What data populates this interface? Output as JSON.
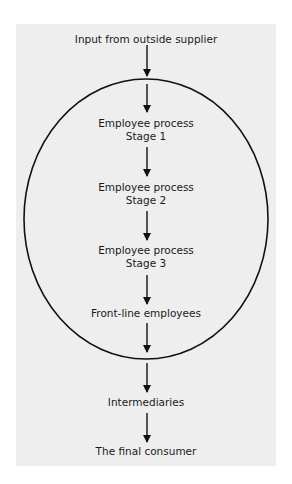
{
  "diagram": {
    "colors": {
      "background": "#ffffff",
      "panel": "#eeeeee",
      "stroke": "#111111",
      "text": "#1a1a1a"
    },
    "ellipse": {
      "cx": 146,
      "cy": 219,
      "rx": 122,
      "ry": 140
    },
    "nodes": [
      {
        "id": "input",
        "lines": [
          "Input from outside supplier"
        ],
        "inside_ellipse": false
      },
      {
        "id": "stage1",
        "lines": [
          "Employee process",
          "Stage 1"
        ],
        "inside_ellipse": true
      },
      {
        "id": "stage2",
        "lines": [
          "Employee process",
          "Stage 2"
        ],
        "inside_ellipse": true
      },
      {
        "id": "stage3",
        "lines": [
          "Employee process",
          "Stage 3"
        ],
        "inside_ellipse": true
      },
      {
        "id": "frontline",
        "lines": [
          "Front-line employees"
        ],
        "inside_ellipse": true
      },
      {
        "id": "intermediaries",
        "lines": [
          "Intermediaries"
        ],
        "inside_ellipse": false
      },
      {
        "id": "consumer",
        "lines": [
          "The final consumer"
        ],
        "inside_ellipse": false
      }
    ],
    "edges": [
      {
        "from": "input",
        "to": "ellipse-boundary"
      },
      {
        "from": "ellipse-boundary",
        "to": "stage1"
      },
      {
        "from": "stage1",
        "to": "stage2"
      },
      {
        "from": "stage2",
        "to": "stage3"
      },
      {
        "from": "stage3",
        "to": "frontline"
      },
      {
        "from": "frontline",
        "to": "ellipse-boundary"
      },
      {
        "from": "ellipse-boundary",
        "to": "intermediaries"
      },
      {
        "from": "intermediaries",
        "to": "consumer"
      }
    ]
  }
}
